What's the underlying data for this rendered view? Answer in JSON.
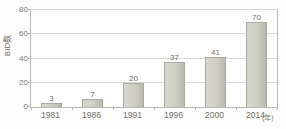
{
  "chart_data": {
    "type": "bar",
    "title": "",
    "subtitle": "",
    "xlabel": "年",
    "ylabel": "BID数",
    "categories": [
      "1981",
      "1986",
      "1991",
      "1996",
      "2000",
      "2014"
    ],
    "values": [
      3,
      7,
      20,
      37,
      41,
      70
    ],
    "value_labels": [
      "3",
      "7",
      "20",
      "37",
      "41",
      "70"
    ],
    "ylim": [
      0,
      80
    ],
    "yticks": [
      0,
      20,
      40,
      60,
      80
    ],
    "ytick_labels": [
      "0",
      "20",
      "40",
      "60",
      "80"
    ],
    "grid": "horizontal",
    "legend": "none",
    "series": [
      {
        "name": "BID数",
        "values": [
          3,
          7,
          20,
          37,
          41,
          70
        ]
      }
    ],
    "annotations": [],
    "colors": {
      "bar_fill": "#cfcfc5",
      "bar_edge": "#a8a89c",
      "gridline": "#d8d8cf",
      "frame": "#b9b9b0",
      "text": "#6f6f68",
      "background": "#fdfdfb"
    }
  }
}
